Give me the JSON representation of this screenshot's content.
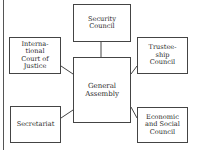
{
  "diagram": {
    "type": "organizational-chart",
    "center": {
      "id": "general",
      "label": "General\nAssembly"
    },
    "nodes": {
      "security": {
        "label": "Security\nCouncil"
      },
      "icj": {
        "label": "Interna-\ntional\nCourt of\nJustice"
      },
      "trustee": {
        "label": "Trustee-\nship\nCouncil"
      },
      "general": {
        "label": "General\nAssembly"
      },
      "secretariat": {
        "label": "Secretariat"
      },
      "ecosoc": {
        "label": "Economic\nand Social\nCouncil"
      }
    },
    "edges": [
      {
        "from": "general",
        "to": "security"
      },
      {
        "from": "general",
        "to": "icj"
      },
      {
        "from": "general",
        "to": "trustee"
      },
      {
        "from": "general",
        "to": "secretariat"
      },
      {
        "from": "general",
        "to": "ecosoc"
      }
    ],
    "colors": {
      "line": "#444444",
      "background": "#ffffff",
      "text": "#2a2a2a"
    }
  }
}
